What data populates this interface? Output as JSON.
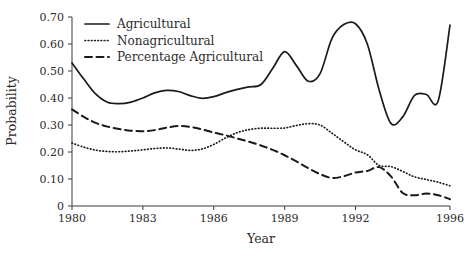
{
  "chart_data": {
    "type": "line",
    "title": "",
    "xlabel": "Year",
    "ylabel": "Probability",
    "xlim": [
      1980,
      1996
    ],
    "ylim": [
      0,
      0.7
    ],
    "grid": false,
    "legend_position": "top-left",
    "xticks": [
      "1980",
      "1983",
      "1986",
      "1989",
      "1992",
      "1996"
    ],
    "xtick_values": [
      1980,
      1983,
      1986,
      1989,
      1992,
      1996
    ],
    "yticks": [
      "0",
      "0.10",
      "0.20",
      "0.30",
      "0.40",
      "0.50",
      "0.60",
      "0.70"
    ],
    "ytick_values": [
      0,
      0.1,
      0.2,
      0.3,
      0.4,
      0.5,
      0.6,
      0.7
    ],
    "x": [
      1980,
      1980.5,
      1981,
      1981.5,
      1982,
      1982.5,
      1983,
      1983.5,
      1984,
      1984.5,
      1985,
      1985.5,
      1986,
      1986.5,
      1987,
      1987.5,
      1988,
      1988.5,
      1989,
      1989.5,
      1990,
      1990.5,
      1991,
      1991.5,
      1992,
      1992.5,
      1993,
      1993.5,
      1994,
      1994.5,
      1995,
      1995.5,
      1996
    ],
    "series": [
      {
        "name": "Agricultural",
        "style": "solid",
        "values": [
          0.53,
          0.47,
          0.415,
          0.384,
          0.379,
          0.385,
          0.4,
          0.419,
          0.428,
          0.424,
          0.409,
          0.399,
          0.405,
          0.42,
          0.432,
          0.441,
          0.45,
          0.51,
          0.572,
          0.52,
          0.462,
          0.49,
          0.62,
          0.672,
          0.675,
          0.6,
          0.43,
          0.306,
          0.33,
          0.41,
          0.413,
          0.39,
          0.67
        ]
      },
      {
        "name": "Nonagricultural",
        "style": "dotted",
        "values": [
          0.233,
          0.218,
          0.207,
          0.202,
          0.201,
          0.204,
          0.208,
          0.213,
          0.215,
          0.211,
          0.206,
          0.211,
          0.228,
          0.252,
          0.272,
          0.283,
          0.288,
          0.288,
          0.289,
          0.298,
          0.305,
          0.3,
          0.27,
          0.238,
          0.208,
          0.19,
          0.18,
          0.16,
          0.144,
          0.148,
          0.133,
          0.112,
          0.104
        ]
      },
      {
        "name": "Percentage Agricultural",
        "style": "dashed",
        "values": [
          0.358,
          0.33,
          0.308,
          0.294,
          0.285,
          0.279,
          0.277,
          0.281,
          0.29,
          0.296,
          0.293,
          0.284,
          0.272,
          0.262,
          0.25,
          0.238,
          0.224,
          0.208,
          0.188,
          0.165,
          0.14,
          0.118,
          0.104,
          0.11,
          0.124,
          0.13,
          0.128,
          0.122,
          0.126,
          0.14,
          0.146,
          0.136,
          0.12
        ]
      }
    ],
    "series_tail": {
      "note": "post-1993 tail points for all three series",
      "x": [
        1993,
        1993.5,
        1994,
        1994.5,
        1995,
        1995.5,
        1996
      ],
      "agricultural": [
        0.43,
        0.306,
        0.33,
        0.41,
        0.413,
        0.39,
        0.67
      ],
      "nonagricultural": [
        0.15,
        0.146,
        0.128,
        0.108,
        0.098,
        0.088,
        0.075
      ],
      "percentage_agricultural": [
        0.144,
        0.11,
        0.048,
        0.04,
        0.046,
        0.04,
        0.025
      ]
    }
  },
  "legend": {
    "items": [
      {
        "label": "Agricultural",
        "style": "solid"
      },
      {
        "label": "Nonagricultural",
        "style": "dotted"
      },
      {
        "label": "Percentage Agricultural",
        "style": "dashed"
      }
    ]
  },
  "axes": {
    "x_title": "Year",
    "y_title": "Probability"
  },
  "colors": {
    "ink": "#1a1a1a",
    "axis": "#3a3a3a",
    "background": "#ffffff"
  }
}
